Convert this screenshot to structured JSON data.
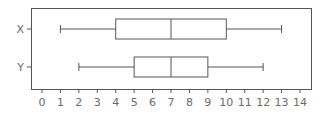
{
  "chart_data": {
    "type": "boxplot",
    "orientation": "horizontal",
    "title": "",
    "xlabel": "",
    "ylabel": "",
    "xlim": [
      0,
      14
    ],
    "x_ticks": [
      "0",
      "1",
      "2",
      "3",
      "4",
      "5",
      "6",
      "7",
      "8",
      "9",
      "10",
      "11",
      "12",
      "13",
      "14"
    ],
    "categories": [
      "X",
      "Y"
    ],
    "series": [
      {
        "name": "X",
        "min": 1,
        "q1": 4,
        "median": 7,
        "q3": 10,
        "max": 13
      },
      {
        "name": "Y",
        "min": 2,
        "q1": 5,
        "median": 7,
        "q3": 9,
        "max": 12
      }
    ],
    "grid": false,
    "legend": null
  },
  "colors": {
    "line": "#555555",
    "text": "#6a6a6a",
    "background": "#ffffff"
  }
}
